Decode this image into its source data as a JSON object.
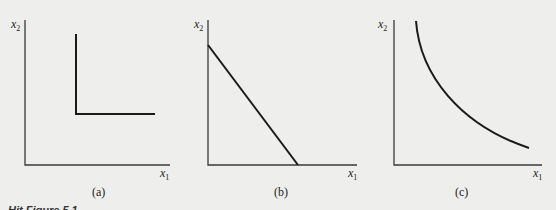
{
  "figure": {
    "caption_partial": "Hit Figure 5.1",
    "panels": [
      {
        "id": "a",
        "caption": "(a)",
        "y_axis_label": "x",
        "y_axis_sub": "2",
        "x_axis_label": "x",
        "x_axis_sub": "1",
        "shape": "L-shaped (perfect complements) indifference curve"
      },
      {
        "id": "b",
        "caption": "(b)",
        "y_axis_label": "x",
        "y_axis_sub": "2",
        "x_axis_label": "x",
        "x_axis_sub": "1",
        "shape": "straight downward-sloping line (perfect substitutes)"
      },
      {
        "id": "c",
        "caption": "(c)",
        "y_axis_label": "x",
        "y_axis_sub": "2",
        "x_axis_label": "x",
        "x_axis_sub": "1",
        "shape": "convex downward-sloping curve"
      }
    ]
  },
  "colors": {
    "background": "#eeeeec",
    "axis": "#3a3a3a",
    "curve": "#1a1a1a"
  }
}
